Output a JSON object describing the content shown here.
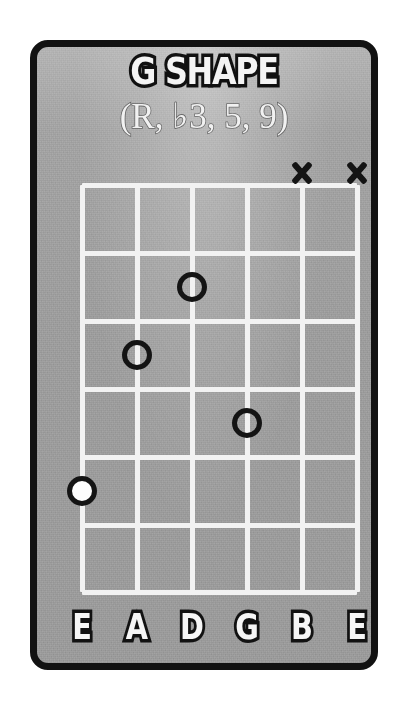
{
  "card": {
    "title": "G SHAPE",
    "subtitle": "(R, ♭3, 5, 9)",
    "border_color": "#121212",
    "background_color": "#9e9e9e",
    "grid_color": "#f2f2f2",
    "marker_color": "#141414",
    "root_fill_color": "#fdfdfd"
  },
  "diagram": {
    "type": "guitar-chord-chart",
    "strings": 6,
    "frets": 6,
    "string_labels": [
      "E",
      "A",
      "D",
      "G",
      "B",
      "E"
    ],
    "string_x": [
      0,
      55,
      110,
      165,
      220,
      275
    ],
    "fret_y": [
      0,
      68,
      136,
      204,
      272,
      340,
      407
    ],
    "markers": [
      {
        "string_index": 2,
        "fret": 2,
        "type": "hollow",
        "label": "",
        "x": 110,
        "y": 102
      },
      {
        "string_index": 1,
        "fret": 3,
        "type": "hollow",
        "label": "",
        "x": 55,
        "y": 170
      },
      {
        "string_index": 3,
        "fret": 4,
        "type": "hollow",
        "label": "",
        "x": 165,
        "y": 238
      },
      {
        "string_index": 0,
        "fret": 5,
        "type": "root",
        "label": "",
        "x": 0,
        "y": 306
      }
    ],
    "mutes": [
      {
        "string_index": 4,
        "symbol": "X",
        "x": 220,
        "y": -12
      },
      {
        "string_index": 5,
        "symbol": "X",
        "x": 275,
        "y": -12
      }
    ]
  }
}
